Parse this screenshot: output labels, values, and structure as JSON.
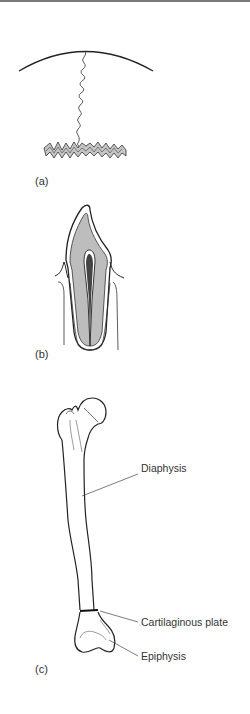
{
  "figure": {
    "panels": [
      {
        "id": "a",
        "label": "(a)"
      },
      {
        "id": "b",
        "label": "(b)"
      },
      {
        "id": "c",
        "label": "(c)"
      }
    ],
    "annotations": {
      "diaphysis": "Diaphysis",
      "cartilaginous_plate": "Cartilaginous plate",
      "epiphysis": "Epiphysis"
    },
    "colors": {
      "line": "#222222",
      "fill_gray": "#bdbdbd",
      "pulp_dark": "#444444",
      "label_text": "#333333",
      "top_rule": "#7a7a7a"
    }
  }
}
